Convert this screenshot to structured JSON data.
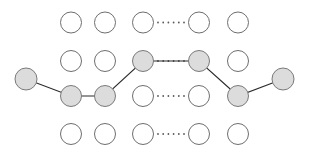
{
  "figure": {
    "kind": "trellis-lattice-path-diagram",
    "background_color": "#ffffff",
    "canvas": {
      "width": 310,
      "height": 161
    }
  },
  "style": {
    "node_radius": 10.5,
    "endpoint_radius": 11,
    "node_plain_fill": "#ffffff",
    "node_plain_stroke": "#6e6e6e",
    "node_shaded_fill": "#dcdcdc",
    "node_shaded_stroke": "#7a7a7a",
    "edge_color": "#2b2b2b",
    "edge_width": 1.1,
    "ellipsis_color": "#5a5a5a",
    "ellipsis_dot_radius": 0.9
  },
  "grid": {
    "column_x": [
      71,
      105,
      143,
      199,
      238
    ],
    "row_y": [
      22.5,
      61,
      96,
      134
    ],
    "ellipsis_between_columns": [
      3,
      4
    ],
    "rows": 4,
    "columns": 5
  },
  "nodes": [
    {
      "id": "r1c1",
      "row": 1,
      "col": 1,
      "cx": 71,
      "cy": 22.5,
      "r": 10.5,
      "state": "plain"
    },
    {
      "id": "r1c2",
      "row": 1,
      "col": 2,
      "cx": 105,
      "cy": 22.5,
      "r": 10.5,
      "state": "plain"
    },
    {
      "id": "r1c3",
      "row": 1,
      "col": 3,
      "cx": 143,
      "cy": 22.5,
      "r": 10.5,
      "state": "plain"
    },
    {
      "id": "r1c4",
      "row": 1,
      "col": 4,
      "cx": 199,
      "cy": 22.5,
      "r": 10.5,
      "state": "plain"
    },
    {
      "id": "r1c5",
      "row": 1,
      "col": 5,
      "cx": 238,
      "cy": 22.5,
      "r": 10.5,
      "state": "plain"
    },
    {
      "id": "r2c1",
      "row": 2,
      "col": 1,
      "cx": 71,
      "cy": 61,
      "r": 10.5,
      "state": "plain"
    },
    {
      "id": "r2c2",
      "row": 2,
      "col": 2,
      "cx": 105,
      "cy": 61,
      "r": 10.5,
      "state": "plain"
    },
    {
      "id": "r2c3",
      "row": 2,
      "col": 3,
      "cx": 143,
      "cy": 61,
      "r": 10.5,
      "state": "shaded"
    },
    {
      "id": "r2c4",
      "row": 2,
      "col": 4,
      "cx": 199,
      "cy": 61,
      "r": 10.5,
      "state": "shaded"
    },
    {
      "id": "r2c5",
      "row": 2,
      "col": 5,
      "cx": 238,
      "cy": 61,
      "r": 10.5,
      "state": "plain"
    },
    {
      "id": "r3c1",
      "row": 3,
      "col": 1,
      "cx": 71,
      "cy": 96,
      "r": 10.5,
      "state": "shaded"
    },
    {
      "id": "r3c2",
      "row": 3,
      "col": 2,
      "cx": 105,
      "cy": 96,
      "r": 10.5,
      "state": "shaded"
    },
    {
      "id": "r3c3",
      "row": 3,
      "col": 3,
      "cx": 143,
      "cy": 96,
      "r": 10.5,
      "state": "plain"
    },
    {
      "id": "r3c4",
      "row": 3,
      "col": 4,
      "cx": 199,
      "cy": 96,
      "r": 10.5,
      "state": "plain"
    },
    {
      "id": "r3c5",
      "row": 3,
      "col": 5,
      "cx": 238,
      "cy": 96,
      "r": 10.5,
      "state": "shaded"
    },
    {
      "id": "r4c1",
      "row": 4,
      "col": 1,
      "cx": 71,
      "cy": 134,
      "r": 10.5,
      "state": "plain"
    },
    {
      "id": "r4c2",
      "row": 4,
      "col": 2,
      "cx": 105,
      "cy": 134,
      "r": 10.5,
      "state": "plain"
    },
    {
      "id": "r4c3",
      "row": 4,
      "col": 3,
      "cx": 143,
      "cy": 134,
      "r": 10.5,
      "state": "plain"
    },
    {
      "id": "r4c4",
      "row": 4,
      "col": 4,
      "cx": 199,
      "cy": 134,
      "r": 10.5,
      "state": "plain"
    },
    {
      "id": "r4c5",
      "row": 4,
      "col": 5,
      "cx": 238,
      "cy": 134,
      "r": 10.5,
      "state": "plain"
    },
    {
      "id": "start",
      "row": 3,
      "col": 0,
      "cx": 26,
      "cy": 79,
      "r": 11,
      "state": "shaded"
    },
    {
      "id": "end",
      "row": 3,
      "col": 6,
      "cx": 283,
      "cy": 79,
      "r": 11,
      "state": "shaded"
    }
  ],
  "path": {
    "label": "highlighted-trellis-path",
    "points": [
      {
        "id": "start",
        "x": 26,
        "y": 79
      },
      {
        "id": "r3c1",
        "x": 71,
        "y": 96
      },
      {
        "id": "r3c2",
        "x": 105,
        "y": 96
      },
      {
        "id": "r2c3",
        "x": 143,
        "y": 61
      },
      {
        "id": "r2c4",
        "x": 199,
        "y": 61
      },
      {
        "id": "r3c5",
        "x": 238,
        "y": 96
      },
      {
        "id": "end",
        "x": 283,
        "y": 79
      }
    ]
  },
  "dotted_links": [
    {
      "row": 1,
      "from": "r1c3",
      "to": "r1c4",
      "y": 22.5,
      "style": "dotted"
    },
    {
      "row": 2,
      "from": "r2c3",
      "to": "r2c4",
      "y": 61,
      "style": "dotted"
    },
    {
      "row": 3,
      "from": "r3c3",
      "to": "r3c4",
      "y": 96,
      "style": "dotted"
    },
    {
      "row": 4,
      "from": "r4c3",
      "to": "r4c4",
      "y": 134,
      "style": "dotted"
    }
  ],
  "ellipsis": {
    "dot_count": 6,
    "x_start": 158,
    "x_end": 184,
    "rows_y": [
      22.5,
      61,
      96,
      134
    ]
  }
}
